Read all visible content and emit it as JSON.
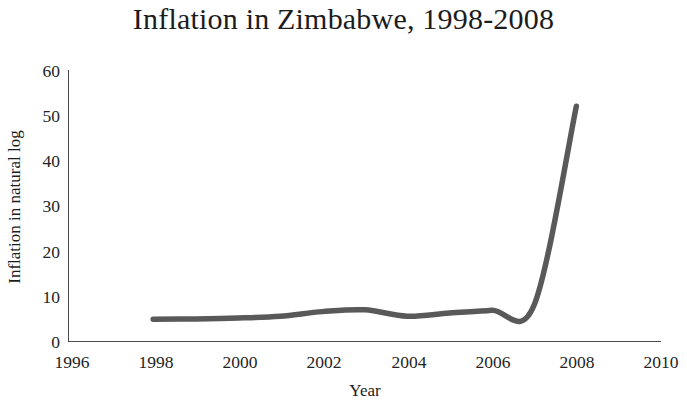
{
  "chart_data": {
    "type": "line",
    "title": "Inflation in Zimbabwe, 1998-2008",
    "xlabel": "Year",
    "ylabel": "Inflation in natural log",
    "xlim": [
      1996,
      2010
    ],
    "ylim": [
      0,
      60
    ],
    "xticks": [
      "1996",
      "1998",
      "2000",
      "2002",
      "2004",
      "2006",
      "2008",
      "2010"
    ],
    "yticks": [
      "0",
      "10",
      "20",
      "30",
      "40",
      "50",
      "60"
    ],
    "grid": false,
    "legend": null,
    "series": [
      {
        "name": "Inflation in natural log",
        "color": "#595959",
        "x": [
          1998,
          1999,
          2000,
          2001,
          2002,
          2003,
          2004,
          2005,
          2006,
          2007,
          2008
        ],
        "values": [
          4.9,
          5.0,
          5.2,
          5.6,
          6.6,
          7.0,
          5.6,
          6.3,
          6.9,
          8.0,
          52.0
        ]
      }
    ]
  },
  "axes": {
    "y_tick_values": [
      60,
      50,
      40,
      30,
      20,
      10,
      0
    ],
    "x_tick_values": [
      1996,
      1998,
      2000,
      2002,
      2004,
      2006,
      2008,
      2010
    ]
  },
  "colors": {
    "line": "#595959",
    "axis": "#4a4a4a",
    "text": "#1c1c1c",
    "background": "#ffffff"
  }
}
